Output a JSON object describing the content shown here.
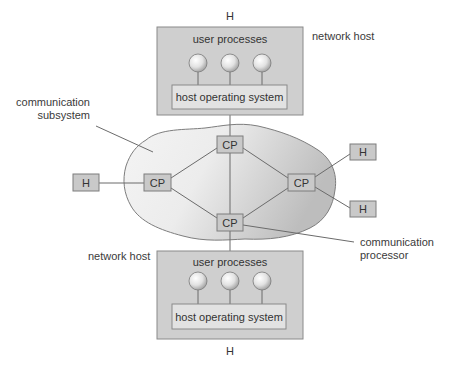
{
  "diagram": {
    "colors": {
      "host_box_fill": "#cfcfcf",
      "host_box_stroke": "#8a8a8a",
      "inner_box_fill": "#e2e2e2",
      "cp_fill": "#c9c9c9",
      "cloud_light": "#f3f3f3",
      "cloud_dark": "#c7c7c7",
      "line": "#6b6b6b"
    },
    "top_host": {
      "h_label": "H",
      "side_label": "network host",
      "processes_label": "user processes",
      "os_label": "host operating system",
      "process_count": 3
    },
    "bottom_host": {
      "h_label": "H",
      "side_label": "network host",
      "processes_label": "user processes",
      "os_label": "host operating system",
      "process_count": 3
    },
    "subsystem": {
      "label_line1": "communication",
      "label_line2": "subsystem"
    },
    "processors": [
      {
        "id": "cp-top",
        "label": "CP"
      },
      {
        "id": "cp-left",
        "label": "CP"
      },
      {
        "id": "cp-right",
        "label": "CP"
      },
      {
        "id": "cp-bottom",
        "label": "CP"
      }
    ],
    "external_hosts": [
      {
        "id": "h-left",
        "label": "H"
      },
      {
        "id": "h-right-top",
        "label": "H"
      },
      {
        "id": "h-right-bottom",
        "label": "H"
      }
    ],
    "processor_callout": {
      "label_line1": "communication",
      "label_line2": "processor"
    }
  }
}
